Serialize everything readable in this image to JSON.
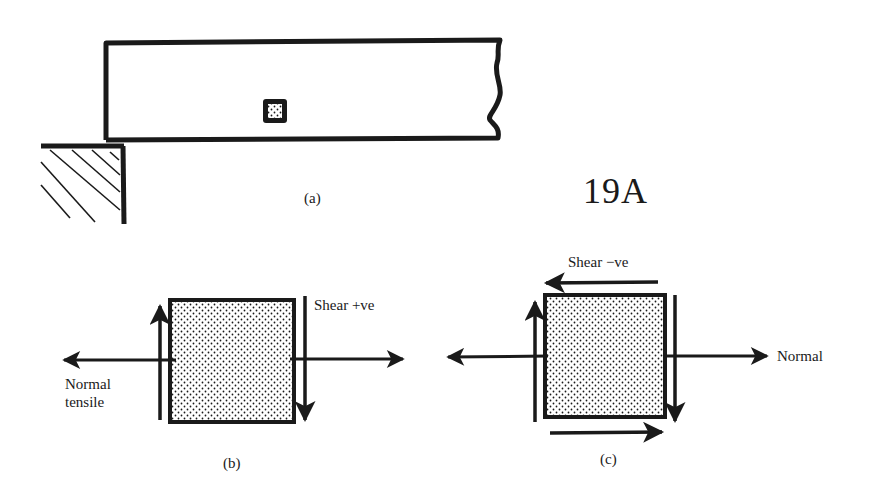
{
  "figure_number": "19A",
  "panels": {
    "a": {
      "caption": "(a)",
      "description": "Cantilever beam on a hatched wall support with a small shaded element"
    },
    "b": {
      "caption": "(b)",
      "labels": {
        "shear": "Shear  +ve",
        "normal_line1": "Normal",
        "normal_line2": "tensile"
      }
    },
    "c": {
      "caption": "(c)",
      "labels": {
        "shear": "Shear  −ve",
        "normal": "Normal"
      }
    }
  },
  "colors": {
    "ink": "#1a1a1a",
    "background": "#ffffff"
  }
}
